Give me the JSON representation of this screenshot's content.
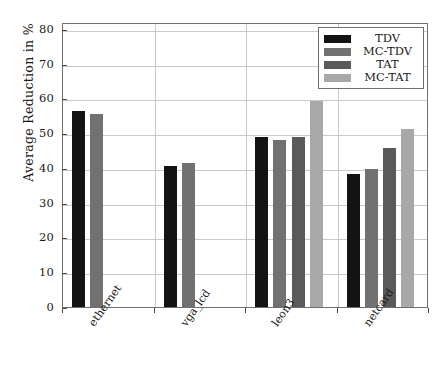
{
  "chart_data": {
    "type": "bar",
    "title": "",
    "xlabel": "",
    "ylabel": "Average Reduction in %",
    "categories": [
      "ethernet",
      "vga_lcd",
      "leon3",
      "netcard"
    ],
    "series": [
      {
        "name": "TDV",
        "color": "#131313",
        "values": [
          56.4,
          40.7,
          48.8,
          38.2
        ]
      },
      {
        "name": "MC-TDV",
        "color": "#717171",
        "values": [
          55.4,
          41.5,
          48.1,
          39.8
        ]
      },
      {
        "name": "TAT",
        "color": "#5a5a5a",
        "values": [
          null,
          null,
          48.9,
          45.8
        ]
      },
      {
        "name": "MC-TAT",
        "color": "#a8a8a8",
        "values": [
          null,
          null,
          59.3,
          51.1
        ]
      }
    ],
    "ylim": [
      0,
      82
    ],
    "yticks": [
      0,
      10,
      20,
      30,
      40,
      50,
      60,
      70,
      80
    ],
    "ytick_labels": [
      "0",
      "10",
      "20",
      "30",
      "40",
      "50",
      "60",
      "70",
      "80"
    ],
    "grid": true,
    "grid_axis": "both",
    "legend_position": "top-right",
    "xtick_rotation": -55
  },
  "legend": {
    "entries": [
      {
        "label": "TDV"
      },
      {
        "label": "MC-TDV"
      },
      {
        "label": "TAT"
      },
      {
        "label": "MC-TAT"
      }
    ]
  },
  "axes": {
    "y_title": "Average Reduction in %"
  },
  "colors": {
    "frame": "#6f6f6f",
    "grid": "#c9c9c9",
    "background": "#ffffff",
    "text": "#1a1a1a"
  }
}
